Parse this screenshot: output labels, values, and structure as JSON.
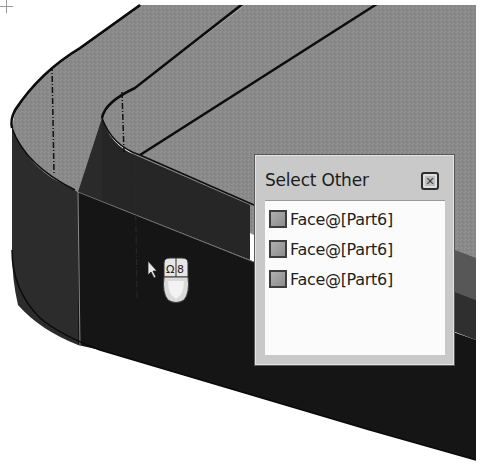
{
  "viewport": {
    "model_colors": {
      "top_face": "#8a8a8a",
      "side_face": "#2a2a2a",
      "front_face": "#141414",
      "edge_line": "#0c0c0c",
      "background": "#ffffff"
    }
  },
  "select_other": {
    "title": "Select Other",
    "close_icon": "close-icon",
    "items": [
      {
        "label": "Face@[Part6]",
        "swatch_color": "#9e9e9e"
      },
      {
        "label": "Face@[Part6]",
        "swatch_color": "#9e9e9e"
      },
      {
        "label": "Face@[Part6]",
        "swatch_color": "#9e9e9e"
      }
    ]
  },
  "cursor": {
    "pointer_icon": "arrow-pointer-icon",
    "mouse_icon": "mouse-select-other-icon",
    "crosshair_icon": "crosshair-icon"
  }
}
